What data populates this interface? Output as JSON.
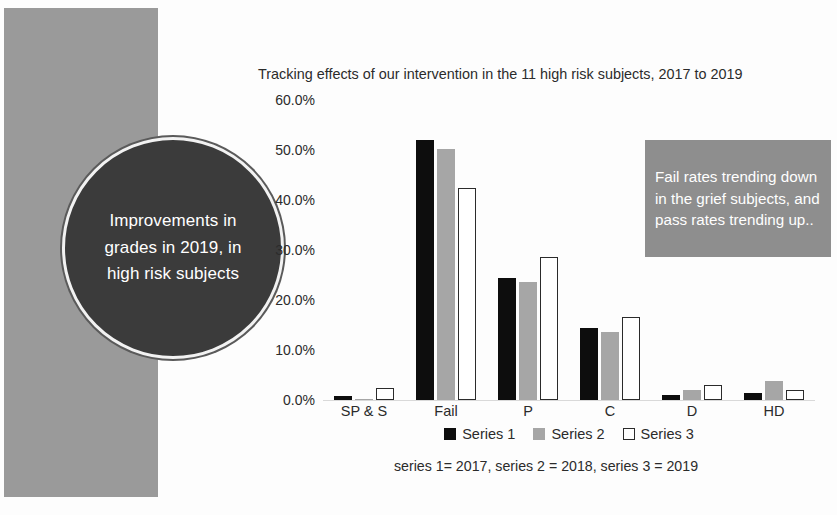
{
  "slide": {
    "background_color": "#fdfdfd",
    "left_panel_color": "#9a9a9a"
  },
  "circle_callout": {
    "text": "Improvements in grades in 2019, in high risk subjects",
    "fill_color": "#3b3b3b",
    "ring_color": "#f2f2f2",
    "text_color": "#ffffff"
  },
  "note_box": {
    "text": "Fail rates trending down in the grief subjects, and pass rates trending up..",
    "fill_color": "#8e8e8e",
    "text_color": "#ffffff"
  },
  "footnote": {
    "text": "series 1= 2017, series 2 = 2018, series 3 = 2019"
  },
  "chart_data": {
    "type": "bar",
    "title": "Tracking effects of our intervention in the 11 high risk subjects, 2017 to 2019",
    "xlabel": "",
    "ylabel": "",
    "ylim": [
      0,
      60
    ],
    "grid": false,
    "legend_position": "bottom",
    "categories": [
      "SP & S",
      "Fail",
      "P",
      "C",
      "D",
      "HD"
    ],
    "ticks": [
      "0.0%",
      "10.0%",
      "20.0%",
      "30.0%",
      "40.0%",
      "50.0%",
      "60.0%"
    ],
    "tick_values": [
      0,
      10,
      20,
      30,
      40,
      50,
      60
    ],
    "series": [
      {
        "name": "Series 1",
        "year": "2017",
        "color": "#0d0d0d",
        "values": [
          0.8,
          53.5,
          25.0,
          14.7,
          1.0,
          1.5
        ]
      },
      {
        "name": "Series 2",
        "year": "2018",
        "color": "#a6a6a6",
        "values": [
          0.3,
          51.5,
          24.3,
          14.0,
          2.0,
          4.0
        ]
      },
      {
        "name": "Series 3",
        "year": "2019",
        "color": "#ffffff",
        "values": [
          2.5,
          43.5,
          29.3,
          17.0,
          3.0,
          2.0
        ]
      }
    ]
  }
}
